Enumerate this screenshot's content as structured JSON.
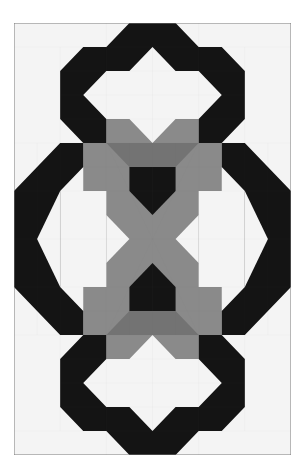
{
  "image": {
    "description": "Pieced quilt block pattern: two black octagonal rings (top and bottom) linked by a black ring pair at left/right, with a gray X-shaped lattice and black pentagons in the center",
    "grid": {
      "columns": 12,
      "rows": 18
    },
    "colors": {
      "background": "#ffffff",
      "white_fabric": "#f4f4f4",
      "black_fabric": "#141414",
      "gray_fabric": "#8a8a8a",
      "dark_gray_fabric": "#737373",
      "seam_lines": "#7a7a7a"
    }
  }
}
